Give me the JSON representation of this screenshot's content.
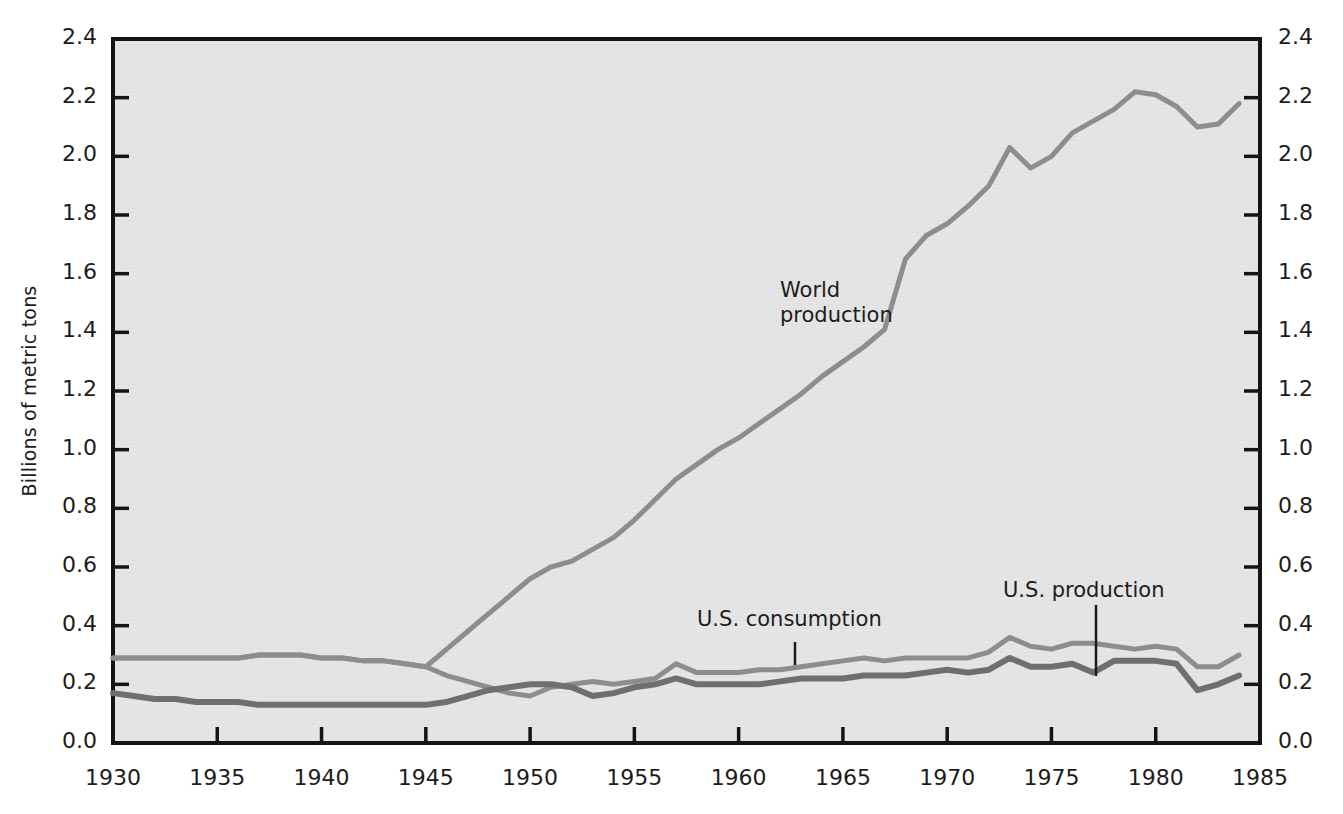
{
  "figure": {
    "background_color": "#ffffff",
    "plot_background_color": "#e4e4e4",
    "axis_color": "#141414"
  },
  "axes": {
    "y_axis_title": "Billions of metric tons",
    "y_ticks": [
      "0.0",
      "0.2",
      "0.4",
      "0.6",
      "0.8",
      "1.0",
      "1.2",
      "1.4",
      "1.6",
      "1.8",
      "2.0",
      "2.2",
      "2.4"
    ],
    "x_ticks": [
      "1930",
      "1935",
      "1940",
      "1945",
      "1950",
      "1955",
      "1960",
      "1965",
      "1970",
      "1975",
      "1980",
      "1985"
    ],
    "y_min": 0.0,
    "y_max": 2.4,
    "x_min": 1930,
    "x_max": 1985
  },
  "annotations": [
    {
      "name": "world-production-label",
      "text_line1": "World",
      "text_line2": "production",
      "x": 780,
      "y": 278
    },
    {
      "name": "us-consumption-label",
      "text_line1": "U.S. consumption",
      "text_line2": "",
      "x": 697,
      "y": 607
    },
    {
      "name": "us-production-label",
      "text_line1": "U.S. production",
      "text_line2": "",
      "x": 1003,
      "y": 578
    }
  ],
  "chart_data": {
    "type": "line",
    "title": "",
    "xlabel": "",
    "ylabel": "Billions of metric tons",
    "xlim": [
      1930,
      1985
    ],
    "ylim": [
      0.0,
      2.4
    ],
    "grid": false,
    "legend": "inline-annotations",
    "x": [
      1930,
      1931,
      1932,
      1933,
      1934,
      1935,
      1936,
      1937,
      1938,
      1939,
      1940,
      1941,
      1942,
      1943,
      1944,
      1945,
      1946,
      1947,
      1948,
      1949,
      1950,
      1951,
      1952,
      1953,
      1954,
      1955,
      1956,
      1957,
      1958,
      1959,
      1960,
      1961,
      1962,
      1963,
      1964,
      1965,
      1966,
      1967,
      1968,
      1969,
      1970,
      1971,
      1972,
      1973,
      1974,
      1975,
      1976,
      1977,
      1978,
      1979,
      1980,
      1981,
      1982,
      1983,
      1984
    ],
    "series": [
      {
        "name": "World production",
        "color": "#8d8d8d",
        "values": [
          0.29,
          0.29,
          0.29,
          0.29,
          0.29,
          0.29,
          0.29,
          0.3,
          0.3,
          0.3,
          0.29,
          0.29,
          0.28,
          0.28,
          0.27,
          0.26,
          0.32,
          0.38,
          0.44,
          0.5,
          0.56,
          0.6,
          0.62,
          0.66,
          0.7,
          0.76,
          0.83,
          0.9,
          0.95,
          1.0,
          1.04,
          1.09,
          1.14,
          1.19,
          1.25,
          1.3,
          1.35,
          1.41,
          1.65,
          1.73,
          1.77,
          1.83,
          1.9,
          2.03,
          1.96,
          2.0,
          2.08,
          2.12,
          2.16,
          2.22,
          2.21,
          2.17,
          2.1,
          2.11,
          2.18
        ]
      },
      {
        "name": "U.S. consumption",
        "color": "#8d8d8d",
        "values": [
          0.29,
          0.29,
          0.29,
          0.29,
          0.29,
          0.29,
          0.29,
          0.3,
          0.3,
          0.3,
          0.29,
          0.29,
          0.28,
          0.28,
          0.27,
          0.26,
          0.23,
          0.21,
          0.19,
          0.17,
          0.16,
          0.19,
          0.2,
          0.21,
          0.2,
          0.21,
          0.22,
          0.27,
          0.24,
          0.24,
          0.24,
          0.25,
          0.25,
          0.26,
          0.27,
          0.28,
          0.29,
          0.28,
          0.29,
          0.29,
          0.29,
          0.29,
          0.31,
          0.36,
          0.33,
          0.32,
          0.34,
          0.34,
          0.33,
          0.32,
          0.33,
          0.32,
          0.26,
          0.26,
          0.3
        ]
      },
      {
        "name": "U.S. production",
        "color": "#6f6f6f",
        "values": [
          0.17,
          0.16,
          0.15,
          0.15,
          0.14,
          0.14,
          0.14,
          0.13,
          0.13,
          0.13,
          0.13,
          0.13,
          0.13,
          0.13,
          0.13,
          0.13,
          0.14,
          0.16,
          0.18,
          0.19,
          0.2,
          0.2,
          0.19,
          0.16,
          0.17,
          0.19,
          0.2,
          0.22,
          0.2,
          0.2,
          0.2,
          0.2,
          0.21,
          0.22,
          0.22,
          0.22,
          0.23,
          0.23,
          0.23,
          0.24,
          0.25,
          0.24,
          0.25,
          0.29,
          0.26,
          0.26,
          0.27,
          0.24,
          0.28,
          0.28,
          0.28,
          0.27,
          0.18,
          0.2,
          0.23
        ]
      }
    ]
  }
}
